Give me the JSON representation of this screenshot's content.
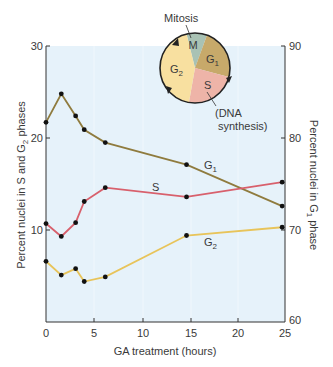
{
  "chart_data": {
    "type": "line",
    "title": "",
    "xlabel": "GA treatment (hours)",
    "ylabel_left": "Percent nuclei in S and G2 phases",
    "ylabel_right": "Percent nuclei in G1 phase",
    "xlim": [
      0,
      25
    ],
    "ylim_left": [
      0,
      30
    ],
    "ylim_right": [
      60,
      90
    ],
    "x_ticks": [
      0,
      5,
      10,
      15,
      20,
      25
    ],
    "y_ticks_left": [
      10,
      20,
      30
    ],
    "y_ticks_right": [
      60,
      70,
      80,
      90
    ],
    "grid": false,
    "series": [
      {
        "name": "G1",
        "axis": "right",
        "color": "#8f7b3e",
        "x": [
          0,
          1.6,
          3.1,
          4.0,
          6.2,
          14.7,
          24.7
        ],
        "values": [
          81.7,
          84.8,
          82.4,
          80.9,
          79.5,
          77.1,
          72.6
        ]
      },
      {
        "name": "S",
        "axis": "left",
        "color": "#d8606c",
        "x": [
          0,
          1.6,
          3.1,
          4.0,
          6.2,
          14.7,
          24.7
        ],
        "values": [
          10.7,
          9.3,
          10.8,
          13.1,
          14.6,
          13.6,
          15.2
        ]
      },
      {
        "name": "G2",
        "axis": "left",
        "color": "#e8c45a",
        "x": [
          0,
          1.6,
          3.1,
          4.0,
          6.2,
          14.7,
          24.7
        ],
        "values": [
          6.6,
          5.1,
          5.8,
          4.4,
          4.9,
          9.4,
          10.3
        ]
      }
    ],
    "inset": {
      "type": "pie",
      "title": "Cell cycle",
      "segments": [
        {
          "label": "M",
          "callout": "Mitosis",
          "color": "#a9c2b4"
        },
        {
          "label": "G1",
          "color": "#c7a96a"
        },
        {
          "label": "S",
          "callout": "(DNA synthesis)",
          "color": "#eeb4a8"
        },
        {
          "label": "G2",
          "color": "#f8e0a0"
        }
      ]
    }
  },
  "labels": {
    "xlabel": "GA treatment (hours)",
    "ylabel_left": "Percent nuclei in S and G",
    "ylabel_left_sub": "2",
    "ylabel_left_end": " phases",
    "ylabel_right": "Percent nuclei in G",
    "ylabel_right_sub": "1",
    "ylabel_right_end": " phase",
    "x_ticks": [
      "0",
      "5",
      "10",
      "15",
      "20",
      "25"
    ],
    "y_left_ticks": [
      "10",
      "20",
      "30"
    ],
    "y_right_ticks": [
      "60",
      "70",
      "80",
      "90"
    ],
    "series_g1": "G",
    "series_g1_sub": "1",
    "series_s": "S",
    "series_g2": "G",
    "series_g2_sub": "2",
    "pie_m": "M",
    "pie_g1": "G",
    "pie_g1_sub": "1",
    "pie_s": "S",
    "pie_g2": "G",
    "pie_g2_sub": "2",
    "pie_mitosis": "Mitosis",
    "pie_dna_1": "(DNA",
    "pie_dna_2": "synthesis)"
  },
  "colors": {
    "plot_bg": "#e6f2fa",
    "g1": "#8f7b3e",
    "s": "#d8606c",
    "g2": "#e8c45a"
  }
}
